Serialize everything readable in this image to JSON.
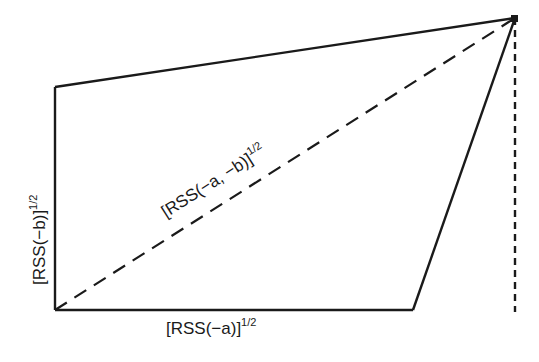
{
  "diagram": {
    "colors": {
      "line": "#1a1a1a",
      "background": "#ffffff"
    },
    "labels": {
      "x_axis": {
        "main": "[RSS(−a)]",
        "sup": "1/2"
      },
      "y_axis": {
        "main": "[RSS(−b)]",
        "sup": "1/2"
      },
      "diagonal": {
        "main": "[RSS(−a, −b)]",
        "sup": "1/2"
      }
    },
    "vertices": {
      "origin": [
        55,
        310
      ],
      "top_left": [
        55,
        87
      ],
      "apex": [
        515,
        18
      ],
      "base_right": [
        413,
        310
      ],
      "apex_drop": [
        515,
        310
      ]
    }
  }
}
